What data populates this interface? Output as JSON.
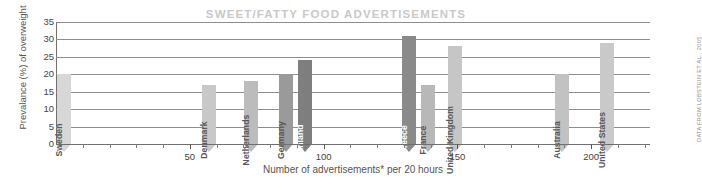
{
  "title": "SWEET/FATTY FOOD ADVERTISEMENTS",
  "credit": "DATA FROM LOBSTEIN ET AL., 2005.",
  "chart_data": {
    "type": "bar",
    "title": "SWEET/FATTY FOOD ADVERTISEMENTS",
    "xlabel": "Number of advertisements* per 20 hours",
    "ylabel": "Prevalance (%) of overweight",
    "xlim": [
      0,
      222
    ],
    "ylim": [
      0,
      35
    ],
    "xticks": [
      50,
      100,
      150,
      200
    ],
    "xtick_labels": [
      "50",
      "100",
      "150",
      "200"
    ],
    "xminor_step": 10,
    "yticks": [
      0,
      5,
      10,
      15,
      20,
      25,
      30,
      35
    ],
    "ytick_labels": [
      "0",
      "5",
      "10",
      "15",
      "20",
      "25",
      "30",
      "35"
    ],
    "grid": "horizontal",
    "legend": "none",
    "categories": [
      "Sweden",
      "Denmark",
      "Netherlands",
      "Germany",
      "Finland",
      "Greece",
      "France",
      "United Kingdom",
      "Australia",
      "United States"
    ],
    "x": [
      3,
      57,
      73,
      86,
      93,
      132,
      139,
      149,
      189,
      206
    ],
    "values": [
      20,
      17,
      18,
      20,
      24,
      31,
      17,
      28,
      20,
      29
    ],
    "bar_colors": [
      "#d7d7d7",
      "#c8c8c8",
      "#bcbcbc",
      "#9a9a9a",
      "#7e7e7e",
      "#8a8a8a",
      "#b8b8b8",
      "#c6c6c6",
      "#c2c2c2",
      "#c9c9c9"
    ],
    "bars": [
      {
        "label": "Sweden",
        "x": 3,
        "value": 20,
        "color": "#d7d7d7",
        "label_tone": "on-light"
      },
      {
        "label": "Denmark",
        "x": 57,
        "value": 17,
        "color": "#c8c8c8",
        "label_tone": "on-light"
      },
      {
        "label": "Netherlands",
        "x": 73,
        "value": 18,
        "color": "#bcbcbc",
        "label_tone": "on-light"
      },
      {
        "label": "Germany",
        "x": 86,
        "value": 20,
        "color": "#9a9a9a",
        "label_tone": "on-light"
      },
      {
        "label": "Finland",
        "x": 93,
        "value": 24,
        "color": "#7e7e7e",
        "label_tone": "on-dark"
      },
      {
        "label": "Greece",
        "x": 132,
        "value": 31,
        "color": "#8a8a8a",
        "label_tone": "on-dark"
      },
      {
        "label": "France",
        "x": 139,
        "value": 17,
        "color": "#b8b8b8",
        "label_tone": "on-light"
      },
      {
        "label": "United Kingdom",
        "x": 149,
        "value": 28,
        "color": "#c6c6c6",
        "label_tone": "on-light"
      },
      {
        "label": "Australia",
        "x": 189,
        "value": 20,
        "color": "#c2c2c2",
        "label_tone": "on-light"
      },
      {
        "label": "United States",
        "x": 206,
        "value": 29,
        "color": "#c9c9c9",
        "label_tone": "on-light"
      }
    ]
  }
}
